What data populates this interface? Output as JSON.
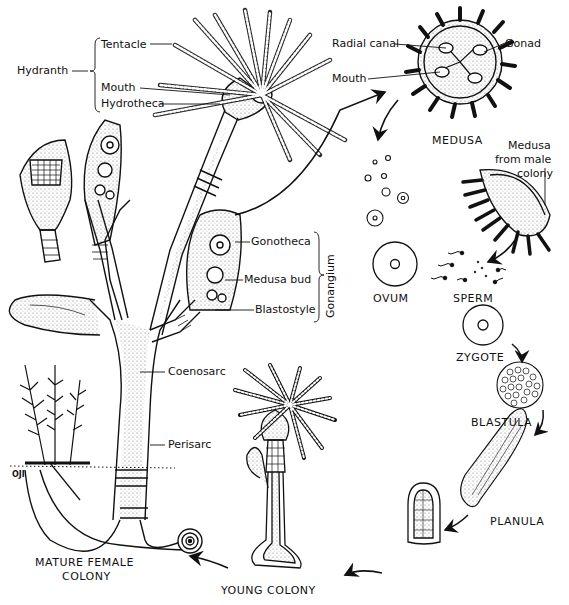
{
  "diagram": {
    "colors": {
      "ink": "#111111",
      "background": "#ffffff",
      "stipple": "#555555"
    },
    "hydroid_labels": {
      "hydranth": "Hydranth",
      "tentacle": "Tentacle",
      "mouth": "Mouth",
      "hydrotheca": "Hydrotheca",
      "gonotheca": "Gonotheca",
      "medusa_bud": "Medusa bud",
      "blastostyle": "Blastostyle",
      "gonangium": "Gonangium",
      "coenosarc": "Coenosarc",
      "perisarc": "Perisarc"
    },
    "medusa_labels": {
      "radial_canal": "Radial canal",
      "gonad": "Gonad",
      "mouth": "Mouth",
      "medusa": "MEDUSA",
      "male_medusa_line1": "Medusa",
      "male_medusa_line2": "from male",
      "male_medusa_line3": "colony"
    },
    "stages": {
      "ovum": "OVUM",
      "sperm": "SPERM",
      "zygote": "ZYGOTE",
      "blastula": "BLASTULA",
      "planula": "PLANULA",
      "young_colony": "YOUNG COLONY",
      "mature_line1": "MATURE FEMALE",
      "mature_line2": "COLONY"
    },
    "scale_mark": "OJI"
  }
}
